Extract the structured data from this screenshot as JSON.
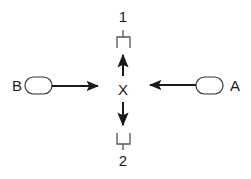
{
  "diagram": {
    "center_label": "X",
    "top_label": "1",
    "bottom_label": "2",
    "left_label": "B",
    "right_label": "A",
    "stroke_color": "#1a1a1a",
    "background": "#ffffff"
  }
}
